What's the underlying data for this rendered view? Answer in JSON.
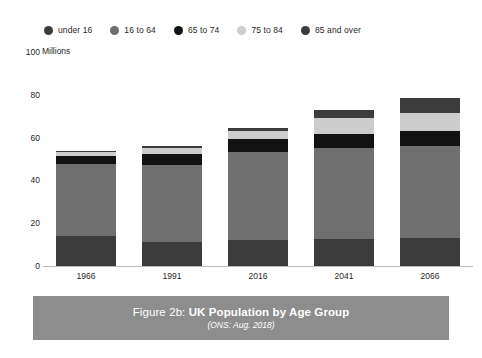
{
  "legend": {
    "items": [
      {
        "label": "under 16",
        "color": "#3c3c3c"
      },
      {
        "label": "16 to 64",
        "color": "#6f6f6f"
      },
      {
        "label": "65 to 74",
        "color": "#121212"
      },
      {
        "label": "75 to 84",
        "color": "#cdcdcd"
      },
      {
        "label": "85 and over",
        "color": "#3c3c3c"
      }
    ]
  },
  "axis": {
    "y_unit_label": "Millions",
    "y_ticks": [
      "0",
      "20",
      "40",
      "60",
      "80",
      "100"
    ],
    "x_ticks": [
      "1966",
      "1991",
      "2016",
      "2041",
      "2066"
    ]
  },
  "caption": {
    "figure_number": "Figure 2b: ",
    "title": "UK Population by Age Group",
    "source": "(ONS: Aug. 2018)"
  },
  "chart_data": {
    "type": "bar",
    "stacked": true,
    "title": "UK Population by Age Group",
    "subtitle": "(ONS: Aug. 2018)",
    "source": "ONS: Aug. 2018",
    "xlabel": "",
    "ylabel": "Millions",
    "ylim": [
      0,
      100
    ],
    "yticks": [
      0,
      20,
      40,
      60,
      80,
      100
    ],
    "grid": false,
    "legend_position": "top",
    "categories": [
      "1966",
      "1991",
      "2016",
      "2041",
      "2066"
    ],
    "series": [
      {
        "name": "under 16",
        "color": "#3c3c3c",
        "values": [
          14.0,
          11.3,
          12.2,
          12.8,
          12.9
        ]
      },
      {
        "name": "16 to 64",
        "color": "#6f6f6f",
        "values": [
          33.6,
          36.0,
          41.3,
          42.2,
          43.1
        ]
      },
      {
        "name": "65 to 74",
        "color": "#121212",
        "values": [
          3.9,
          4.9,
          5.8,
          6.9,
          7.3
        ]
      },
      {
        "name": "75 to 84",
        "color": "#cdcdcd",
        "values": [
          1.9,
          2.8,
          3.6,
          7.5,
          8.1
        ]
      },
      {
        "name": "85 and over",
        "color": "#3c3c3c",
        "values": [
          0.4,
          0.9,
          1.6,
          3.6,
          7.3
        ]
      }
    ],
    "totals": [
      53.8,
      55.9,
      64.5,
      73.0,
      78.7
    ]
  }
}
